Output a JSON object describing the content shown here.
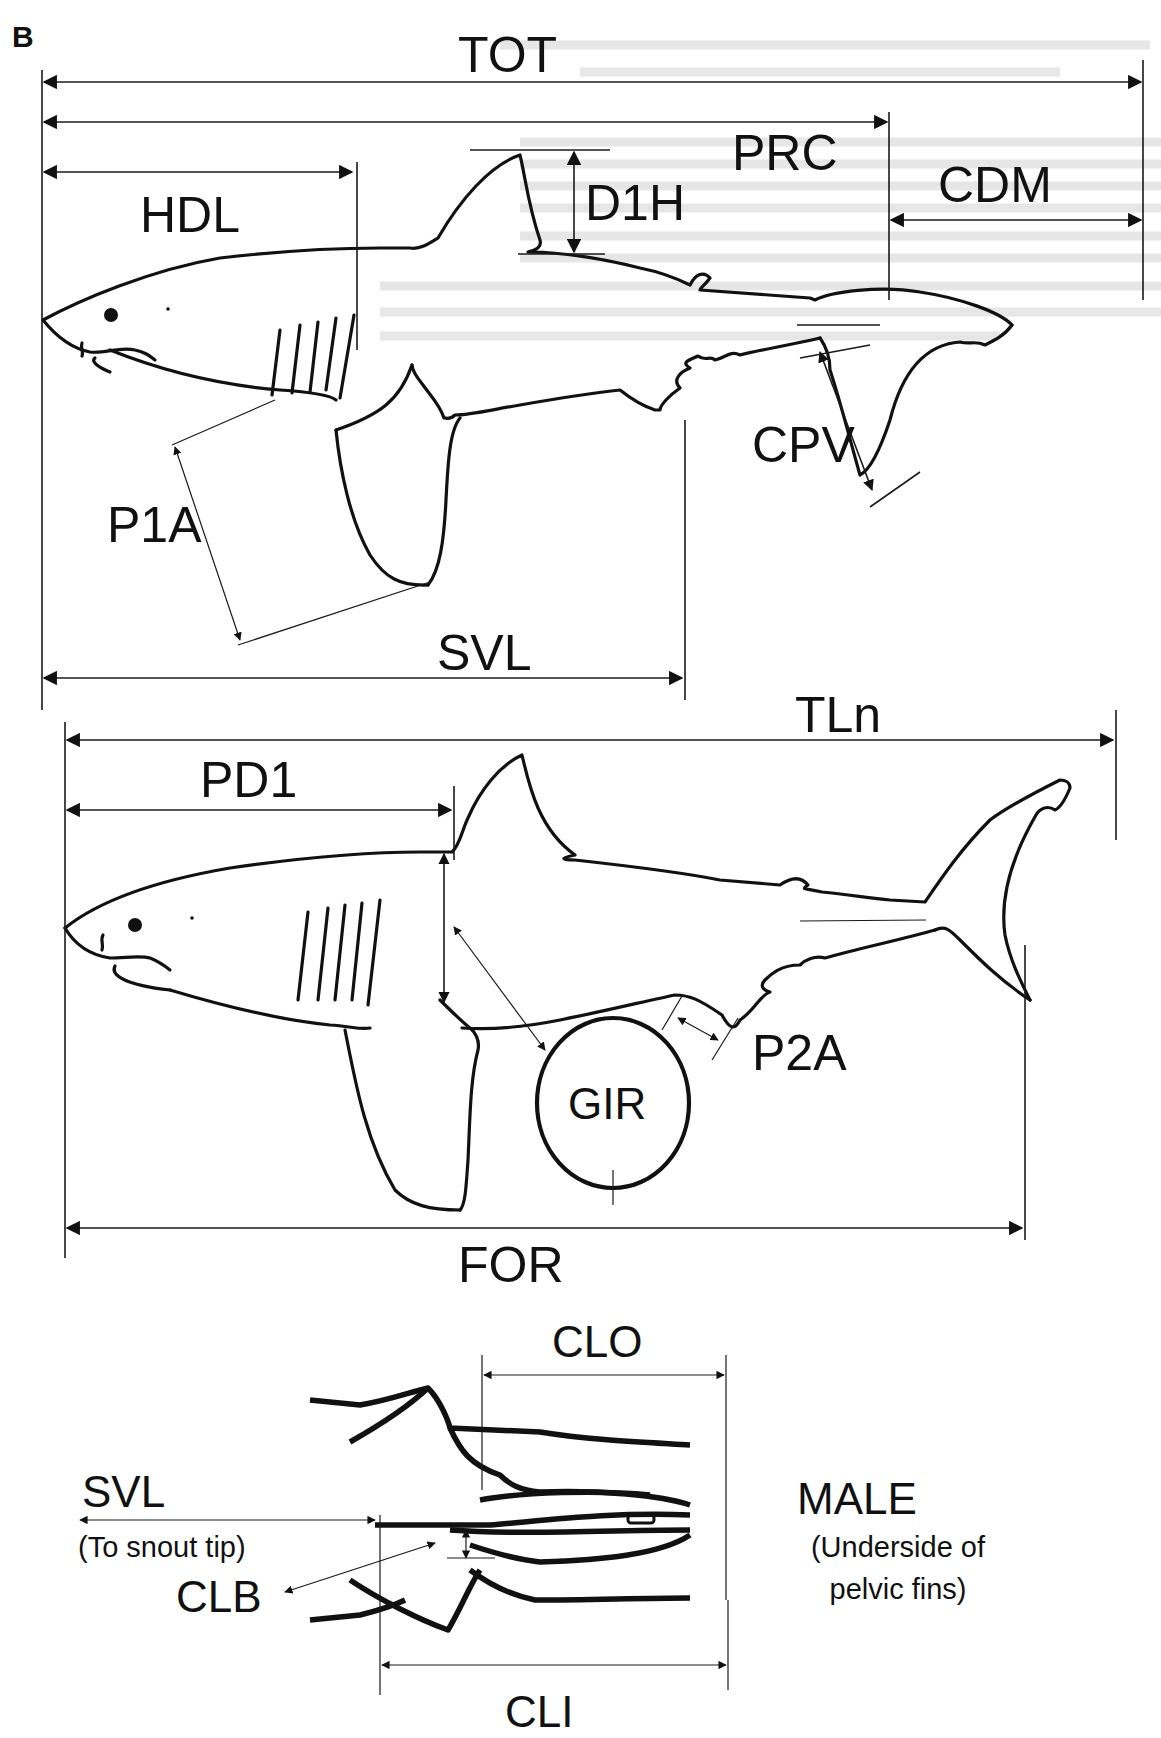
{
  "panel_label": "B",
  "top_shark": {
    "measurements": {
      "TOT": "TOT",
      "PRC": "PRC",
      "HDL": "HDL",
      "D1H": "D1H",
      "CDM": "CDM",
      "CPV": "CPV",
      "P1A": "P1A",
      "SVL": "SVL"
    }
  },
  "middle_shark": {
    "measurements": {
      "TLn": "TLn",
      "PD1": "PD1",
      "P2A": "P2A",
      "GIR": "GIR",
      "FOR": "FOR"
    }
  },
  "pelvic_detail": {
    "measurements": {
      "CLO": "CLO",
      "CLI": "CLI",
      "CLB": "CLB",
      "SVL": "SVL"
    },
    "svl_note": "(To snout tip)",
    "sex_label": "MALE",
    "view_note_line1": "(Underside of",
    "view_note_line2": "pelvic fins)"
  },
  "colors": {
    "ink": "#111111",
    "background": "#ffffff",
    "bleed_through": "#e4e4e4"
  }
}
